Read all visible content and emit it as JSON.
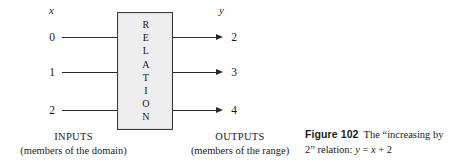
{
  "diagram": {
    "input_variable": "x",
    "output_variable": "y",
    "inputs": [
      "0",
      "1",
      "2"
    ],
    "outputs": [
      "2",
      "3",
      "4"
    ],
    "box": {
      "letters": [
        "R",
        "E",
        "L",
        "A",
        "T",
        "I",
        "O",
        "N"
      ],
      "word": "RELATION",
      "fill_color": "#efeeee",
      "border_color": "#3a3a3a"
    },
    "input_caption": {
      "title": "INPUTS",
      "subtitle": "(members of the domain)"
    },
    "output_caption": {
      "title": "OUTPUTS",
      "subtitle": "(members of the range)"
    }
  },
  "figure_caption": {
    "number": "Figure 102",
    "text": "The “increasing by 2” relation:",
    "equation": "y = x + 2",
    "equation_parts": {
      "lhs": "y",
      "equals": "=",
      "rhs_var": "x",
      "plus": "+",
      "constant": "2"
    }
  }
}
